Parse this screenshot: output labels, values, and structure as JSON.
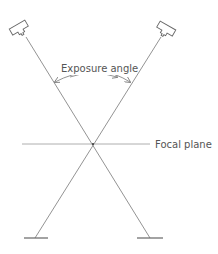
{
  "diagram": {
    "labels": {
      "exposure_angle": "Exposure angle",
      "focal_plane": "Focal plane"
    },
    "colors": {
      "line": "#777777",
      "text": "#555555",
      "background": "#ffffff"
    },
    "elements": {
      "left_tube": "x-ray-tube-icon",
      "right_tube": "x-ray-tube-icon",
      "left_detector": "detector-bar",
      "right_detector": "detector-bar"
    }
  }
}
